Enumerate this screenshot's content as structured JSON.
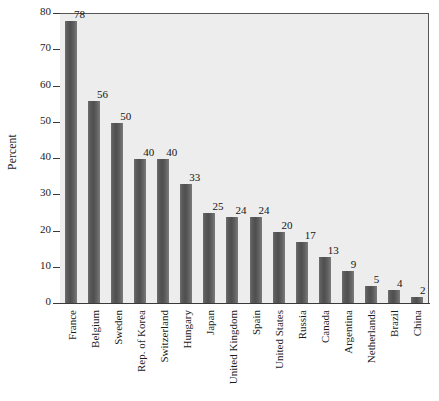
{
  "chart_data": {
    "type": "bar",
    "title": "",
    "xlabel": "",
    "ylabel": "Percent",
    "ylim": [
      0,
      80
    ],
    "yticks": [
      0,
      10,
      20,
      30,
      40,
      50,
      60,
      70,
      80
    ],
    "grid": false,
    "legend": null,
    "categories": [
      "France",
      "Belgium",
      "Sweden",
      "Rep. of Korea",
      "Switzerland",
      "Hungary",
      "Japan",
      "United Kingdom",
      "Spain",
      "United States",
      "Russia",
      "Canada",
      "Argentina",
      "Netherlands",
      "Brazil",
      "China"
    ],
    "values": [
      78,
      56,
      50,
      40,
      40,
      33,
      25,
      24,
      24,
      20,
      17,
      13,
      9,
      5,
      4,
      2
    ],
    "data_labels": [
      "78",
      "56",
      "50",
      "40",
      "40",
      "33",
      "25",
      "24",
      "24",
      "20",
      "17",
      "13",
      "9",
      "5",
      "4",
      "2"
    ],
    "tick_labels": [
      "0",
      "10",
      "20",
      "30",
      "40",
      "50",
      "60",
      "70",
      "80"
    ],
    "colors": {
      "bar": "#5a5a5a",
      "plot_background": "#ededed",
      "axis": "#3a3a3a",
      "text": "#1b1b1b",
      "page_background": "#ffffff"
    }
  }
}
